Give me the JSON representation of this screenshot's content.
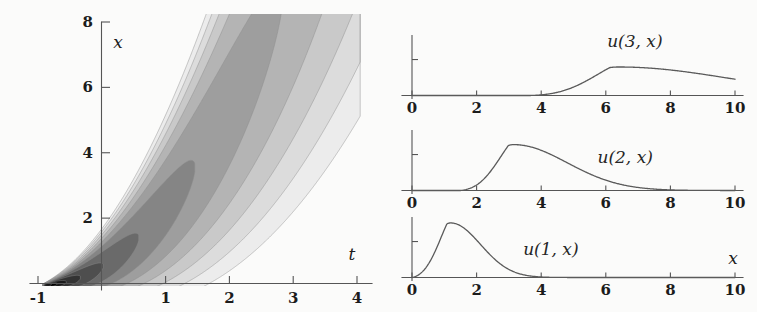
{
  "figure": {
    "background_color": "#fbfbfa",
    "width": 757,
    "height": 312
  },
  "contour_plot": {
    "name": "contour-plot-u-t-x",
    "xlabel": "t",
    "ylabel": "x",
    "t_ticks": [
      "-1",
      "1",
      "2",
      "3",
      "4"
    ],
    "t_tick_values": [
      -1,
      1,
      2,
      3,
      4
    ],
    "x_ticks": [
      "2",
      "4",
      "6",
      "8"
    ],
    "x_tick_values": [
      2,
      4,
      6,
      8
    ],
    "t_range": [
      -1,
      4
    ],
    "x_range": [
      0,
      8
    ],
    "palette": [
      "#ffffff",
      "#ececec",
      "#dcdcdc",
      "#c9c9c9",
      "#b4b4b4",
      "#9e9e9e",
      "#858585",
      "#6a6a6a",
      "#4e4e4e",
      "#333333",
      "#1a1a1a",
      "#000000"
    ],
    "contour_levels": 12,
    "core": {
      "t": 0.2,
      "x": 0.25
    }
  },
  "traces": [
    {
      "name": "u(3,x)",
      "label": "u(3, x)",
      "label_position": {
        "x": 6.9,
        "y_frac": 0.78
      },
      "peak_x": 6.4,
      "peak_height_frac": 0.46,
      "onset_x": 3.65,
      "end_value_frac": 0.1
    },
    {
      "name": "u(2,x)",
      "label": "u(2, x)",
      "label_position": {
        "x": 6.6,
        "y_frac": 0.45
      },
      "peak_x": 3.15,
      "peak_height_frac": 0.74,
      "onset_x": 1.5,
      "end_value_frac": 0.0
    },
    {
      "name": "u(1,x)",
      "label": "u(1, x)",
      "label_position": {
        "x": 4.3,
        "y_frac": 0.36
      },
      "peak_x": 1.2,
      "peak_height_frac": 0.88,
      "onset_x": 0.0,
      "end_value_frac": 0.0
    }
  ],
  "trace_axes": {
    "x_ticks": [
      "0",
      "2",
      "4",
      "6",
      "8",
      "10"
    ],
    "x_tick_values": [
      0,
      2,
      4,
      6,
      8,
      10
    ],
    "x_range": [
      0,
      10
    ],
    "xlabel": "x"
  }
}
